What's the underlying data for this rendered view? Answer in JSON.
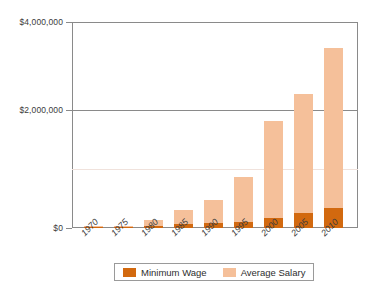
{
  "chart_data": {
    "type": "bar",
    "stacked": true,
    "title": "",
    "subtitle": "",
    "xlabel": "",
    "ylabel": "",
    "categories": [
      "1970",
      "1975",
      "1980",
      "1985",
      "1990",
      "1995",
      "2000",
      "2005",
      "2010"
    ],
    "series": [
      {
        "name": "Minimum Wage",
        "color": "#d2690f",
        "values": [
          10000,
          20000,
          40000,
          70000,
          100000,
          110000,
          190000,
          300000,
          390000
        ]
      },
      {
        "name": "Average Salary",
        "color": "#f5c09a",
        "values": [
          10000,
          20000,
          110000,
          280000,
          450000,
          890000,
          1890000,
          2300000,
          3110000
        ]
      }
    ],
    "totals": [
      20000,
      40000,
      150000,
      350000,
      550000,
      1000000,
      2080000,
      2600000,
      3500000
    ],
    "ylim": [
      0,
      4000000
    ],
    "ytick_values": [
      0,
      2000000,
      4000000
    ],
    "ytick_labels": [
      "$0",
      "$2,000,000",
      "$4,000,000"
    ],
    "grid": "horizontal-major",
    "legend_position": "bottom"
  },
  "axis": {
    "y_ticks": [
      {
        "label": "$4,000,000",
        "value": 4000000
      },
      {
        "label": "$2,000,000",
        "value": 2000000
      },
      {
        "label": "$0",
        "value": 0
      }
    ],
    "x_ticks": [
      "1970",
      "1975",
      "1980",
      "1985",
      "1990",
      "1995",
      "2000",
      "2005",
      "2010"
    ]
  },
  "legend": {
    "items": [
      {
        "label": "Minimum Wage",
        "color": "#d2690f",
        "swatch": "legend-swatch-minimum-wage"
      },
      {
        "label": "Average Salary",
        "color": "#f5c09a",
        "swatch": "legend-swatch-average-salary"
      }
    ]
  },
  "colors": {
    "minimum_wage": "#d2690f",
    "average_salary": "#f5c09a",
    "axis": "#8a8a8a",
    "text": "#3b3b3b",
    "background": "#ffffff"
  }
}
